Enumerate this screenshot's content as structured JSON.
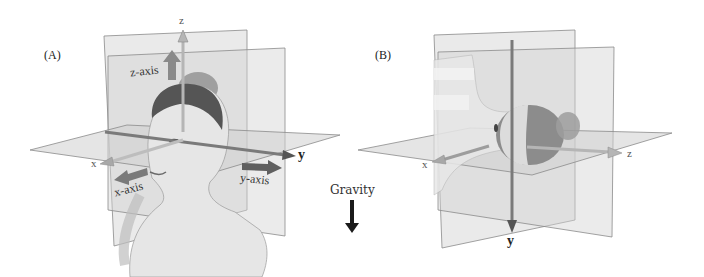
{
  "panelA": {
    "label": "(A)",
    "axes": {
      "z": "z",
      "x": "x",
      "y": "y"
    },
    "axis_names": {
      "z": "z-axis",
      "x": "x-axis",
      "y": "y-axis"
    }
  },
  "gravity": {
    "label": "Gravity",
    "arrow": "down-arrow"
  },
  "panelB": {
    "label": "(B)",
    "axes": {
      "x": "x",
      "z": "z",
      "y": "y"
    }
  },
  "colors": {
    "plane_fill": "#d6d6d6",
    "plane_stroke": "#8a8a8a",
    "axis_rod": "#9a9a9a",
    "axis_arrow": "#6e6e6e",
    "gravity_arrow": "#1a1a1a"
  }
}
